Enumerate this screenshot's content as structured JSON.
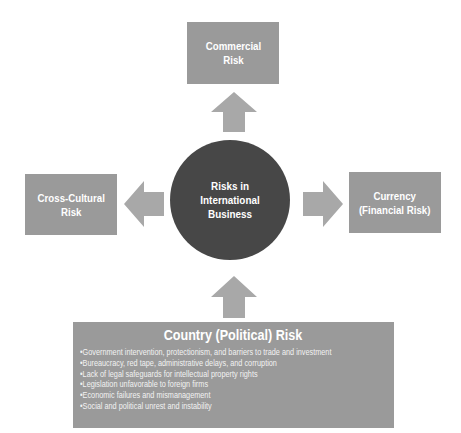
{
  "diagram": {
    "center": {
      "label": "Risks in\nInternational\nBusiness",
      "color": "#474747"
    },
    "top": {
      "label": "Commercial\nRisk"
    },
    "left": {
      "label": "Cross-Cultural\nRisk"
    },
    "right": {
      "label": "Currency\n(Financial Risk)"
    },
    "bottom": {
      "title": "Country (Political) Risk",
      "items": [
        "Government intervention, protectionism, and barriers to trade and investment",
        "Bureaucracy, red tape, administrative delays, and corruption",
        "Lack of legal safeguards for intellectual property rights",
        "Legislation unfavorable to foreign firms",
        "Economic failures and mismanagement",
        "Social and political unrest and instability"
      ]
    },
    "colors": {
      "box": "#9a9a9a",
      "arrow": "#a8a8a8",
      "hub": "#474747",
      "text": "#ffffff"
    }
  }
}
